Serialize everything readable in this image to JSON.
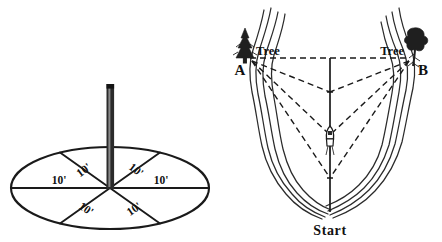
{
  "figure": {
    "title": "",
    "background_color": "#ffffff",
    "ink_color": "#1a1a1a",
    "panels": [
      {
        "id": "left",
        "name": "pole-and-radius-circle"
      },
      {
        "id": "right",
        "name": "cove-triangulation-map"
      }
    ]
  },
  "left_panel": {
    "name": "circle-with-pole",
    "pole": {
      "name": "vertical-pole",
      "color": "#2b2b2b",
      "highlight_color": "#7a7a7a"
    },
    "circle": {
      "name": "ground-circle-ellipse",
      "center_x": 110,
      "center_y": 188,
      "radius_x": 99,
      "radius_y": 41
    },
    "radius_labels": [
      {
        "text": "10'",
        "position": "west",
        "rotation": 0
      },
      {
        "text": "10'",
        "position": "northwest",
        "rotation": -37
      },
      {
        "text": "10'",
        "position": "northeast",
        "rotation": 37
      },
      {
        "text": "10'",
        "position": "east",
        "rotation": 0
      },
      {
        "text": "10'",
        "position": "southeast",
        "rotation": -35
      },
      {
        "text": "10'",
        "position": "southwest",
        "rotation": 35
      }
    ]
  },
  "right_panel": {
    "name": "cove-chart",
    "labels": {
      "tree_left": "Tree",
      "tree_right": "Tree",
      "point_a": "A",
      "point_b": "B",
      "start": "Start"
    },
    "markers": {
      "boat": "boat-icon",
      "tree_left_icon": "pine-tree-icon",
      "tree_right_icon": "leafy-tree-icon"
    },
    "sight_lines": {
      "style": "dashed",
      "from_points": [
        "A",
        "B"
      ],
      "converge_y": [
        92,
        135,
        178
      ]
    },
    "baseline": {
      "name": "tree-to-tree-baseline",
      "style": "dashed",
      "from": "A",
      "to": "B"
    },
    "course_line": {
      "name": "center-course-line",
      "style": "solid",
      "from": "baseline-midpoint",
      "to": "Start"
    }
  }
}
